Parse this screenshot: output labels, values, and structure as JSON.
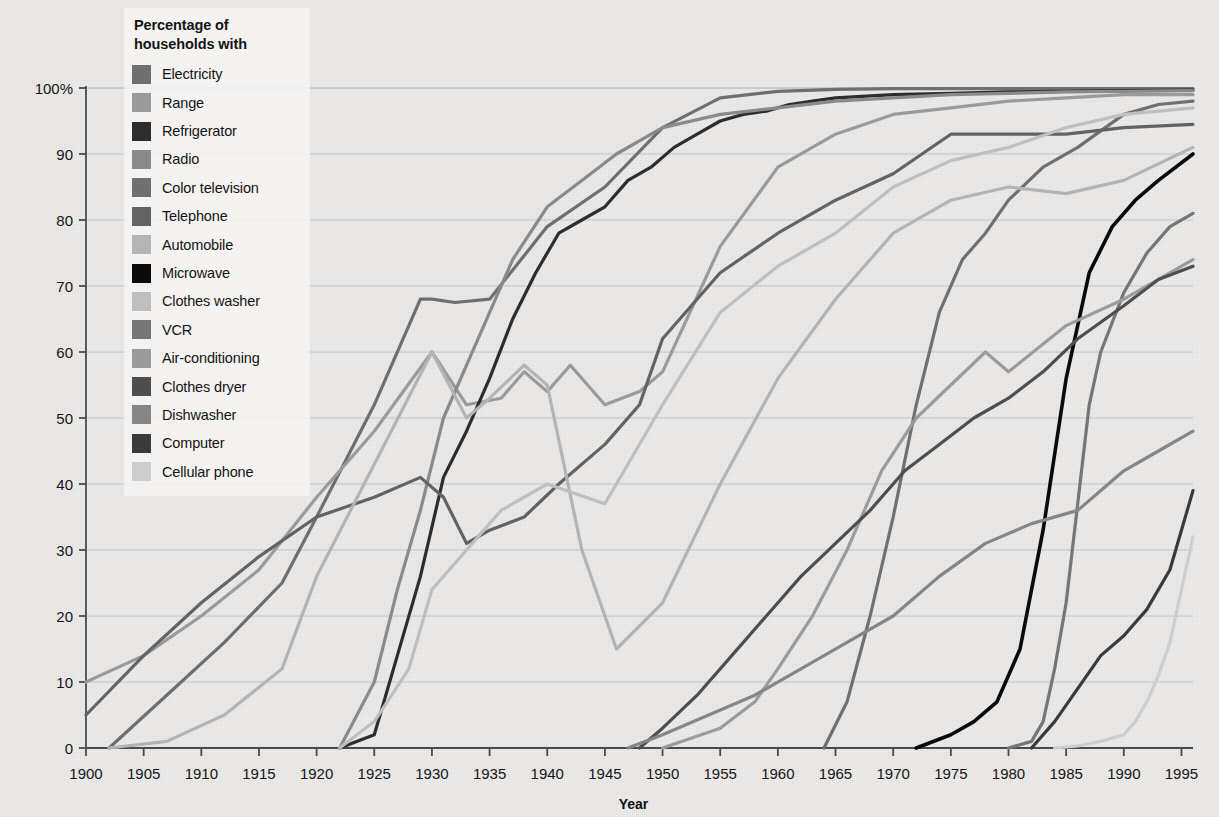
{
  "chart_data": {
    "type": "line",
    "title": "",
    "xlabel": "Year",
    "ylabel": "",
    "legend_title": "Percentage of households with",
    "legend_position": "top-left-inside",
    "grid": true,
    "xlim": [
      1900,
      1996
    ],
    "ylim": [
      0,
      100
    ],
    "xticks": [
      1900,
      1905,
      1910,
      1915,
      1920,
      1925,
      1930,
      1935,
      1940,
      1945,
      1950,
      1955,
      1960,
      1965,
      1970,
      1975,
      1980,
      1985,
      1990,
      1995
    ],
    "xtick_labels": [
      "1900",
      "1905",
      "1910",
      "1915",
      "1920",
      "1925",
      "1930",
      "1935",
      "1940",
      "1945",
      "1950",
      "1955",
      "1960",
      "1965",
      "1970",
      "1975",
      "1980",
      "1985",
      "1990",
      "1995"
    ],
    "yticks": [
      0,
      10,
      20,
      30,
      40,
      50,
      60,
      70,
      80,
      90,
      100
    ],
    "ytick_labels": [
      "0",
      "10",
      "20",
      "30",
      "40",
      "50",
      "60",
      "70",
      "80",
      "90",
      "100%"
    ],
    "series": [
      {
        "name": "Electricity",
        "color": "#6f6f6f",
        "width": 3.2,
        "x": [
          1902,
          1907,
          1912,
          1917,
          1920,
          1925,
          1929,
          1930,
          1932,
          1935,
          1940,
          1945,
          1950,
          1955,
          1960,
          1965,
          1970,
          1975,
          1980,
          1985,
          1990,
          1996
        ],
        "values": [
          0,
          8,
          16,
          25,
          35,
          52,
          68,
          68,
          67.5,
          68,
          79,
          85,
          94,
          98.5,
          99.5,
          99.8,
          99.9,
          99.9,
          99.9,
          99.9,
          99.9,
          99.9
        ]
      },
      {
        "name": "Range",
        "color": "#9a9a9a",
        "width": 3.2,
        "x": [
          1900,
          1905,
          1910,
          1915,
          1920,
          1925,
          1930,
          1933,
          1936,
          1938,
          1940,
          1942,
          1945,
          1948,
          1950,
          1955,
          1960,
          1965,
          1970,
          1975,
          1980,
          1985,
          1990,
          1996
        ],
        "values": [
          10,
          14,
          20,
          27,
          38,
          48,
          60,
          52,
          53,
          57,
          54,
          58,
          52,
          54,
          57,
          76,
          88,
          93,
          96,
          97,
          98,
          98.5,
          99,
          99
        ]
      },
      {
        "name": "Refrigerator",
        "color": "#2d2d2d",
        "width": 3.2,
        "x": [
          1922,
          1925,
          1927,
          1929,
          1931,
          1933,
          1935,
          1937,
          1939,
          1941,
          1943,
          1945,
          1947,
          1949,
          1951,
          1953,
          1955,
          1957,
          1959,
          1961,
          1963,
          1965,
          1970,
          1975,
          1980,
          1985,
          1990,
          1996
        ],
        "values": [
          0,
          2,
          14,
          26,
          41,
          48,
          56,
          65,
          72,
          78,
          80,
          82,
          86,
          88,
          91,
          93,
          95,
          96,
          96.5,
          97.5,
          98,
          98.5,
          99,
          99.2,
          99.4,
          99.5,
          99.6,
          99.7
        ]
      },
      {
        "name": "Radio",
        "color": "#8a8a8a",
        "width": 3.2,
        "x": [
          1922,
          1925,
          1927,
          1929,
          1931,
          1934,
          1937,
          1940,
          1943,
          1946,
          1950,
          1955,
          1960,
          1965,
          1970,
          1975,
          1980,
          1985,
          1990,
          1996
        ],
        "values": [
          0,
          10,
          24,
          36,
          50,
          62,
          74,
          82,
          86,
          90,
          94,
          96,
          97,
          98,
          98.5,
          99,
          99.2,
          99.4,
          99.5,
          99.6
        ]
      },
      {
        "name": "Color television",
        "color": "#707070",
        "width": 3.2,
        "x": [
          1964,
          1966,
          1968,
          1970,
          1972,
          1974,
          1976,
          1978,
          1980,
          1983,
          1986,
          1990,
          1993,
          1996
        ],
        "values": [
          0,
          7,
          20,
          35,
          52,
          66,
          74,
          78,
          83,
          88,
          91,
          96,
          97.5,
          98
        ]
      },
      {
        "name": "Telephone",
        "color": "#636363",
        "width": 3.2,
        "x": [
          1900,
          1905,
          1910,
          1915,
          1920,
          1925,
          1929,
          1931,
          1933,
          1935,
          1938,
          1941,
          1945,
          1948,
          1950,
          1955,
          1960,
          1965,
          1970,
          1975,
          1980,
          1985,
          1990,
          1996
        ],
        "values": [
          5,
          14,
          22,
          29,
          35,
          38,
          41,
          38,
          31,
          33,
          35,
          40,
          46,
          52,
          62,
          72,
          78,
          83,
          87,
          93,
          93,
          93,
          94,
          94.5
        ]
      },
      {
        "name": "Automobile",
        "color": "#b4b4b4",
        "width": 3.2,
        "x": [
          1902,
          1907,
          1912,
          1917,
          1920,
          1925,
          1930,
          1933,
          1935,
          1938,
          1940,
          1943,
          1946,
          1950,
          1955,
          1960,
          1965,
          1970,
          1975,
          1980,
          1985,
          1990,
          1996
        ],
        "values": [
          0,
          1,
          5,
          12,
          26,
          43,
          60,
          50,
          53,
          58,
          55,
          30,
          15,
          22,
          40,
          56,
          68,
          78,
          83,
          85,
          84,
          86,
          91
        ]
      },
      {
        "name": "Microwave",
        "color": "#0a0a0a",
        "width": 3.6,
        "x": [
          1972,
          1975,
          1977,
          1979,
          1981,
          1983,
          1985,
          1987,
          1989,
          1991,
          1993,
          1996
        ],
        "values": [
          0,
          2,
          4,
          7,
          15,
          33,
          56,
          72,
          79,
          83,
          86,
          90
        ]
      },
      {
        "name": "Clothes washer",
        "color": "#bfbfbf",
        "width": 3.2,
        "x": [
          1922,
          1925,
          1928,
          1930,
          1933,
          1936,
          1940,
          1945,
          1950,
          1955,
          1960,
          1965,
          1970,
          1975,
          1980,
          1985,
          1990,
          1996
        ],
        "values": [
          0,
          4,
          12,
          24,
          30,
          36,
          40,
          37,
          52,
          66,
          73,
          78,
          85,
          89,
          91,
          94,
          96,
          97
        ]
      },
      {
        "name": "VCR",
        "color": "#767676",
        "width": 3.2,
        "x": [
          1980,
          1982,
          1983,
          1984,
          1985,
          1986,
          1987,
          1988,
          1990,
          1992,
          1994,
          1996
        ],
        "values": [
          0,
          1,
          4,
          12,
          22,
          37,
          52,
          60,
          69,
          75,
          79,
          81
        ]
      },
      {
        "name": "Air-conditioning",
        "color": "#9b9b9b",
        "width": 3.2,
        "x": [
          1950,
          1955,
          1958,
          1960,
          1963,
          1966,
          1969,
          1972,
          1975,
          1978,
          1980,
          1985,
          1990,
          1996
        ],
        "values": [
          0,
          3,
          7,
          12,
          20,
          30,
          42,
          50,
          55,
          60,
          57,
          64,
          68,
          74
        ]
      },
      {
        "name": "Clothes dryer",
        "color": "#4e4e4e",
        "width": 3.2,
        "x": [
          1948,
          1950,
          1953,
          1956,
          1959,
          1962,
          1965,
          1968,
          1971,
          1974,
          1977,
          1980,
          1983,
          1986,
          1990,
          1993,
          1996
        ],
        "values": [
          0,
          3,
          8,
          14,
          20,
          26,
          31,
          36,
          42,
          46,
          50,
          53,
          57,
          62,
          67,
          71,
          73
        ]
      },
      {
        "name": "Dishwasher",
        "color": "#868686",
        "width": 3.2,
        "x": [
          1947,
          1950,
          1954,
          1958,
          1962,
          1966,
          1970,
          1974,
          1978,
          1982,
          1986,
          1990,
          1993,
          1996
        ],
        "values": [
          0,
          2,
          5,
          8,
          12,
          16,
          20,
          26,
          31,
          34,
          36,
          42,
          45,
          48
        ]
      },
      {
        "name": "Computer",
        "color": "#3a3a3a",
        "width": 3.2,
        "x": [
          1982,
          1984,
          1986,
          1988,
          1990,
          1992,
          1994,
          1996
        ],
        "values": [
          0,
          4,
          9,
          14,
          17,
          21,
          27,
          39
        ]
      },
      {
        "name": "Cellular phone",
        "color": "#cdcdcd",
        "width": 3.2,
        "x": [
          1984,
          1986,
          1988,
          1990,
          1991,
          1992,
          1993,
          1994,
          1995,
          1996
        ],
        "values": [
          0,
          0.3,
          1,
          2,
          4,
          7,
          11,
          16,
          24,
          32
        ]
      }
    ]
  },
  "legend": {
    "title": "Percentage of households with",
    "items": [
      {
        "label": "Electricity",
        "color": "#6f6f6f"
      },
      {
        "label": "Range",
        "color": "#9a9a9a"
      },
      {
        "label": "Refrigerator",
        "color": "#2d2d2d"
      },
      {
        "label": "Radio",
        "color": "#8a8a8a"
      },
      {
        "label": "Color television",
        "color": "#707070"
      },
      {
        "label": "Telephone",
        "color": "#636363"
      },
      {
        "label": "Automobile",
        "color": "#b4b4b4"
      },
      {
        "label": "Microwave",
        "color": "#0a0a0a"
      },
      {
        "label": "Clothes washer",
        "color": "#bfbfbf"
      },
      {
        "label": "VCR",
        "color": "#767676"
      },
      {
        "label": "Air-conditioning",
        "color": "#9b9b9b"
      },
      {
        "label": "Clothes dryer",
        "color": "#4e4e4e"
      },
      {
        "label": "Dishwasher",
        "color": "#868686"
      },
      {
        "label": "Computer",
        "color": "#3a3a3a"
      },
      {
        "label": "Cellular phone",
        "color": "#cdcdcd"
      }
    ]
  },
  "axes": {
    "x_title": "Year",
    "y_top_label": "100%"
  },
  "style": {
    "background": "#eeecea",
    "axis_color": "#4a4a4a",
    "grid_color": "#9aa0a6",
    "text_color": "#141414"
  }
}
